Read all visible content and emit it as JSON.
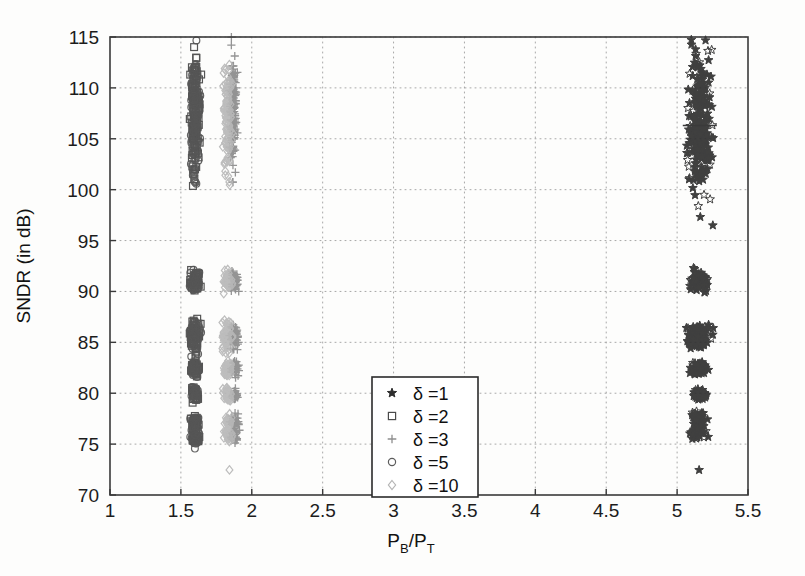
{
  "figure": {
    "kind": "scatter-plot",
    "background_color": "#fdfdfc",
    "axis_color": "#3a3a3a",
    "grid_color": "#9a9a9a"
  },
  "chart_data": {
    "type": "scatter",
    "title": "",
    "xlabel": "P_B/P_T",
    "xlabel_parts": {
      "main1": "P",
      "sub1": "B",
      "slash": "/",
      "main2": "P",
      "sub2": "T"
    },
    "ylabel": "SNDR (in dB)",
    "xlim": [
      1,
      5.5
    ],
    "ylim": [
      70,
      115
    ],
    "xticks": [
      1,
      1.5,
      2,
      2.5,
      3,
      3.5,
      4,
      4.5,
      5,
      5.5
    ],
    "xtick_labels": [
      "1",
      "1.5",
      "2",
      "2.5",
      "3",
      "3.5",
      "4",
      "4.5",
      "5",
      "5.5"
    ],
    "yticks": [
      70,
      75,
      80,
      85,
      90,
      95,
      100,
      105,
      110,
      115
    ],
    "ytick_labels": [
      "70",
      "75",
      "80",
      "85",
      "90",
      "95",
      "100",
      "105",
      "110",
      "115"
    ],
    "grid": true,
    "grid_style": "dotted",
    "legend_position": "center",
    "legend_entries": [
      {
        "marker": "star",
        "label": "δ =1",
        "color": "#2d2d2d"
      },
      {
        "marker": "square",
        "label": "δ =2",
        "color": "#4a4a4a"
      },
      {
        "marker": "plus",
        "label": "δ =3",
        "color": "#8e8e8e"
      },
      {
        "marker": "circle",
        "label": "δ =5",
        "color": "#5c5c5c"
      },
      {
        "marker": "diamond",
        "label": "δ =10",
        "color": "#b4b4b4"
      }
    ],
    "series": [
      {
        "name": "δ =1",
        "marker": "star",
        "color": "#303030",
        "x_center": 5.16,
        "clusters": [
          {
            "x": 5.16,
            "x_spread": 0.075,
            "y_center": 106.5,
            "y_spread": 6.3,
            "n": 240
          },
          {
            "x": 5.16,
            "x_spread": 0.055,
            "y_center": 91.0,
            "y_spread": 0.9,
            "n": 70
          },
          {
            "x": 5.15,
            "x_spread": 0.075,
            "y_center": 85.9,
            "y_spread": 0.75,
            "n": 75
          },
          {
            "x": 5.15,
            "x_spread": 0.075,
            "y_center": 85.0,
            "y_spread": 0.55,
            "n": 70
          },
          {
            "x": 5.16,
            "x_spread": 0.055,
            "y_center": 82.4,
            "y_spread": 0.55,
            "n": 60
          },
          {
            "x": 5.16,
            "x_spread": 0.05,
            "y_center": 79.9,
            "y_spread": 0.45,
            "n": 55
          },
          {
            "x": 5.15,
            "x_spread": 0.05,
            "y_center": 77.4,
            "y_spread": 0.6,
            "n": 55
          },
          {
            "x": 5.15,
            "x_spread": 0.045,
            "y_center": 76.2,
            "y_spread": 0.55,
            "n": 50
          },
          {
            "x": 5.15,
            "x_spread": 0.005,
            "y_center": 72.5,
            "y_spread": 0.05,
            "n": 1
          }
        ]
      },
      {
        "name": "δ =2",
        "marker": "square",
        "color": "#474747",
        "x_center": 1.6,
        "clusters": [
          {
            "x": 1.6,
            "x_spread": 0.03,
            "y_center": 107.5,
            "y_spread": 5.2,
            "n": 140
          },
          {
            "x": 1.6,
            "x_spread": 0.03,
            "y_center": 91.0,
            "y_spread": 0.9,
            "n": 45
          },
          {
            "x": 1.6,
            "x_spread": 0.032,
            "y_center": 85.6,
            "y_spread": 1.5,
            "n": 60
          },
          {
            "x": 1.6,
            "x_spread": 0.028,
            "y_center": 82.4,
            "y_spread": 0.7,
            "n": 40
          },
          {
            "x": 1.6,
            "x_spread": 0.022,
            "y_center": 79.9,
            "y_spread": 0.6,
            "n": 32
          },
          {
            "x": 1.6,
            "x_spread": 0.028,
            "y_center": 77.1,
            "y_spread": 0.6,
            "n": 28
          },
          {
            "x": 1.6,
            "x_spread": 0.028,
            "y_center": 75.7,
            "y_spread": 0.6,
            "n": 26
          },
          {
            "x": 1.6,
            "x_spread": 0.004,
            "y_center": 102.0,
            "y_spread": 0.05,
            "n": 1
          }
        ]
      },
      {
        "name": "δ =3",
        "marker": "plus",
        "color": "#8c8c8c",
        "x_center": 1.87,
        "clusters": [
          {
            "x": 1.87,
            "x_spread": 0.022,
            "y_center": 107.8,
            "y_spread": 5.0,
            "n": 130
          },
          {
            "x": 1.88,
            "x_spread": 0.025,
            "y_center": 91.0,
            "y_spread": 0.9,
            "n": 45
          },
          {
            "x": 1.88,
            "x_spread": 0.028,
            "y_center": 85.6,
            "y_spread": 1.5,
            "n": 55
          },
          {
            "x": 1.88,
            "x_spread": 0.025,
            "y_center": 82.4,
            "y_spread": 0.7,
            "n": 40
          },
          {
            "x": 1.88,
            "x_spread": 0.022,
            "y_center": 79.9,
            "y_spread": 0.6,
            "n": 30
          },
          {
            "x": 1.88,
            "x_spread": 0.025,
            "y_center": 77.3,
            "y_spread": 0.6,
            "n": 30
          },
          {
            "x": 1.88,
            "x_spread": 0.025,
            "y_center": 75.8,
            "y_spread": 0.6,
            "n": 28
          },
          {
            "x": 1.87,
            "x_spread": 0.005,
            "y_center": 102.4,
            "y_spread": 0.05,
            "n": 1
          }
        ]
      },
      {
        "name": "δ =5",
        "marker": "circle",
        "color": "#575757",
        "x_center": 1.6,
        "clusters": [
          {
            "x": 1.6,
            "x_spread": 0.03,
            "y_center": 107.0,
            "y_spread": 5.4,
            "n": 130
          },
          {
            "x": 1.6,
            "x_spread": 0.03,
            "y_center": 91.0,
            "y_spread": 0.9,
            "n": 42
          },
          {
            "x": 1.6,
            "x_spread": 0.032,
            "y_center": 85.6,
            "y_spread": 1.5,
            "n": 55
          },
          {
            "x": 1.6,
            "x_spread": 0.028,
            "y_center": 82.4,
            "y_spread": 0.7,
            "n": 38
          },
          {
            "x": 1.6,
            "x_spread": 0.022,
            "y_center": 79.9,
            "y_spread": 0.6,
            "n": 30
          },
          {
            "x": 1.6,
            "x_spread": 0.028,
            "y_center": 77.1,
            "y_spread": 0.6,
            "n": 28
          },
          {
            "x": 1.6,
            "x_spread": 0.028,
            "y_center": 75.6,
            "y_spread": 0.6,
            "n": 26
          },
          {
            "x": 1.6,
            "x_spread": 0.004,
            "y_center": 100.8,
            "y_spread": 0.05,
            "n": 1
          },
          {
            "x": 1.6,
            "x_spread": 0.004,
            "y_center": 74.6,
            "y_spread": 0.05,
            "n": 1
          }
        ]
      },
      {
        "name": "δ =10",
        "marker": "diamond",
        "color": "#b8b8b8",
        "x_center": 1.83,
        "clusters": [
          {
            "x": 1.83,
            "x_spread": 0.03,
            "y_center": 107.4,
            "y_spread": 5.3,
            "n": 120
          },
          {
            "x": 1.83,
            "x_spread": 0.03,
            "y_center": 91.0,
            "y_spread": 0.9,
            "n": 45
          },
          {
            "x": 1.83,
            "x_spread": 0.032,
            "y_center": 85.6,
            "y_spread": 1.5,
            "n": 58
          },
          {
            "x": 1.83,
            "x_spread": 0.028,
            "y_center": 82.4,
            "y_spread": 0.7,
            "n": 40
          },
          {
            "x": 1.83,
            "x_spread": 0.026,
            "y_center": 79.9,
            "y_spread": 0.6,
            "n": 34
          },
          {
            "x": 1.83,
            "x_spread": 0.028,
            "y_center": 77.2,
            "y_spread": 0.6,
            "n": 30
          },
          {
            "x": 1.83,
            "x_spread": 0.028,
            "y_center": 75.8,
            "y_spread": 0.6,
            "n": 28
          },
          {
            "x": 1.84,
            "x_spread": 0.005,
            "y_center": 72.5,
            "y_spread": 0.05,
            "n": 1
          }
        ]
      }
    ],
    "annotations": [
      {
        "type": "hline-marker",
        "x": 5.16,
        "y": 106.3,
        "half_width": 0.12,
        "color": "#3a3a3a"
      }
    ]
  }
}
